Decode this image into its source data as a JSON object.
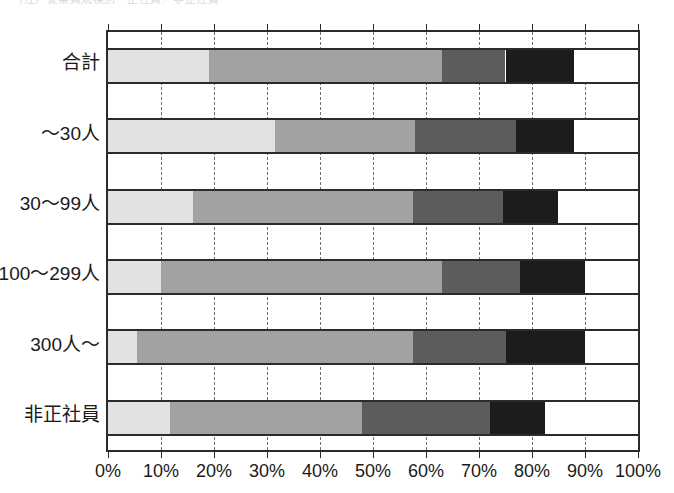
{
  "caption": {
    "text": "（注）従業員規模別・正社員／非正社員",
    "visible_partial": true
  },
  "chart_data": {
    "type": "bar",
    "orientation": "horizontal",
    "stacked": true,
    "normalized_percent": true,
    "title": "",
    "xlabel": "",
    "ylabel": "",
    "xlim": [
      0,
      100
    ],
    "grid": true,
    "grid_axis": "x",
    "grid_style": "dashed",
    "legend": "none",
    "categories": [
      "合計",
      "～30人",
      "30～99人",
      "100～299人",
      "300人～",
      "非正社員"
    ],
    "tick_labels": [
      "0%",
      "10%",
      "20%",
      "30%",
      "40%",
      "50%",
      "60%",
      "70%",
      "80%",
      "90%",
      "100%"
    ],
    "tick_values": [
      0,
      10,
      20,
      30,
      40,
      50,
      60,
      70,
      80,
      90,
      100
    ],
    "series": [
      {
        "name": "segment-1",
        "color": "#e2e2e2",
        "values": [
          19.0,
          31.5,
          16.0,
          10.0,
          5.5,
          11.7
        ]
      },
      {
        "name": "segment-2",
        "color": "#a2a2a2",
        "values": [
          44.0,
          26.5,
          41.5,
          53.0,
          52.0,
          36.3
        ]
      },
      {
        "name": "segment-3",
        "color": "#5c5c5c",
        "values": [
          12.0,
          19.0,
          17.0,
          14.7,
          17.5,
          24.0
        ]
      },
      {
        "name": "segment-4",
        "color": "#1c1c1c",
        "values": [
          13.0,
          11.0,
          10.5,
          12.3,
          15.0,
          10.5
        ]
      },
      {
        "name": "segment-5",
        "color": "#ffffff",
        "values": [
          12.0,
          12.0,
          15.0,
          10.0,
          10.0,
          17.5
        ]
      }
    ],
    "cumulative_boundaries": [
      [
        19.0,
        63.0,
        75.0,
        88.0,
        100.0
      ],
      [
        31.5,
        58.0,
        77.0,
        88.0,
        100.0
      ],
      [
        16.0,
        57.5,
        74.5,
        85.0,
        100.0
      ],
      [
        10.0,
        63.0,
        77.7,
        90.0,
        100.0
      ],
      [
        5.5,
        57.5,
        75.0,
        90.0,
        100.0
      ],
      [
        11.7,
        48.0,
        72.0,
        82.5,
        100.0
      ]
    ]
  },
  "colors": {
    "axis": "#2b2b2b",
    "gridline": "#6e6e6e",
    "text": "#1a1a1a",
    "background": "#ffffff"
  }
}
